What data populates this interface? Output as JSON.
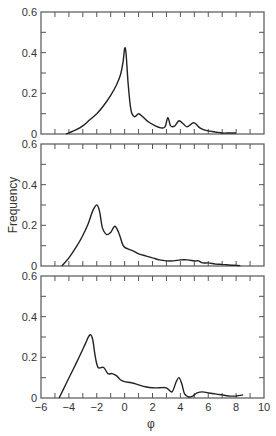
{
  "chart_data": [
    {
      "type": "line",
      "panel": "top",
      "title": "",
      "xlabel": "",
      "ylabel": "",
      "xlim": [
        -6,
        10
      ],
      "ylim": [
        0,
        0.6
      ],
      "yticks": [
        "0",
        "0.2",
        "0.4",
        "0.6"
      ],
      "x": [
        -4.2,
        -3.5,
        -3.0,
        -2.5,
        -2.0,
        -1.5,
        -1.0,
        -0.6,
        -0.3,
        -0.1,
        0.0,
        0.1,
        0.25,
        0.45,
        0.7,
        1.0,
        1.3,
        1.7,
        2.2,
        2.6,
        2.9,
        3.1,
        3.3,
        3.6,
        3.9,
        4.2,
        4.5,
        4.9,
        5.1,
        5.4,
        5.7,
        6.0,
        6.5,
        7.0,
        7.5,
        8.0
      ],
      "values": [
        0.0,
        0.02,
        0.04,
        0.07,
        0.1,
        0.14,
        0.19,
        0.24,
        0.29,
        0.36,
        0.42,
        0.4,
        0.25,
        0.12,
        0.085,
        0.1,
        0.085,
        0.06,
        0.04,
        0.03,
        0.035,
        0.08,
        0.04,
        0.04,
        0.065,
        0.05,
        0.035,
        0.055,
        0.05,
        0.03,
        0.02,
        0.015,
        0.01,
        0.005,
        0.005,
        0.005
      ]
    },
    {
      "type": "line",
      "panel": "middle",
      "title": "",
      "xlabel": "",
      "ylabel": "Frequency",
      "xlim": [
        -6,
        10
      ],
      "ylim": [
        0,
        0.6
      ],
      "yticks": [
        "0",
        "0.2",
        "0.4",
        "0.6"
      ],
      "x": [
        -4.5,
        -4.0,
        -3.5,
        -3.0,
        -2.6,
        -2.3,
        -2.0,
        -1.8,
        -1.6,
        -1.3,
        -1.0,
        -0.7,
        -0.4,
        -0.1,
        0.2,
        0.6,
        1.0,
        1.5,
        2.0,
        2.5,
        3.0,
        3.5,
        4.0,
        4.5,
        5.0,
        5.3,
        5.6,
        6.0,
        6.5,
        7.0,
        7.5,
        8.0,
        8.3
      ],
      "values": [
        0.0,
        0.04,
        0.09,
        0.15,
        0.21,
        0.27,
        0.3,
        0.27,
        0.19,
        0.155,
        0.165,
        0.195,
        0.16,
        0.1,
        0.085,
        0.075,
        0.06,
        0.05,
        0.04,
        0.03,
        0.025,
        0.025,
        0.03,
        0.03,
        0.025,
        0.025,
        0.015,
        0.015,
        0.01,
        0.008,
        0.005,
        0.003,
        0.002
      ]
    },
    {
      "type": "line",
      "panel": "bottom",
      "title": "",
      "xlabel": "φ",
      "ylabel": "",
      "xlim": [
        -6,
        10
      ],
      "ylim": [
        0,
        0.6
      ],
      "xticks": [
        "−6",
        "−4",
        "−2",
        "0",
        "2",
        "4",
        "6",
        "8",
        "10"
      ],
      "yticks": [
        "0",
        "0.2",
        "0.4",
        "0.6"
      ],
      "x": [
        -4.7,
        -4.2,
        -3.7,
        -3.2,
        -2.8,
        -2.5,
        -2.3,
        -2.1,
        -1.9,
        -1.5,
        -1.2,
        -0.9,
        -0.6,
        -0.3,
        0.0,
        0.5,
        1.0,
        1.5,
        2.0,
        2.5,
        3.0,
        3.4,
        3.7,
        3.9,
        4.1,
        4.3,
        4.6,
        4.9,
        5.2,
        5.6,
        6.0,
        6.5,
        7.0,
        7.5,
        8.0,
        8.5
      ],
      "values": [
        0.0,
        0.07,
        0.14,
        0.21,
        0.27,
        0.31,
        0.29,
        0.2,
        0.15,
        0.15,
        0.12,
        0.12,
        0.11,
        0.09,
        0.08,
        0.075,
        0.065,
        0.055,
        0.05,
        0.05,
        0.05,
        0.03,
        0.08,
        0.1,
        0.07,
        0.02,
        0.005,
        0.01,
        0.025,
        0.03,
        0.025,
        0.02,
        0.015,
        0.01,
        0.01,
        0.015
      ]
    }
  ],
  "labels": {
    "y_axis": "Frequency",
    "x_axis": "φ"
  },
  "colors": {
    "line": "#222222",
    "axis": "#555555",
    "text": "#333333"
  }
}
